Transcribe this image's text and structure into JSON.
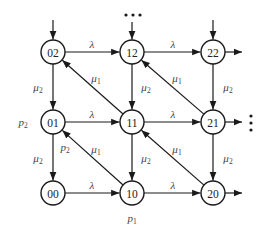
{
  "diagram": {
    "node_radius": 12,
    "nodes": [
      {
        "id": "02",
        "label": "02",
        "x": 53,
        "y": 52
      },
      {
        "id": "12",
        "label": "12",
        "x": 132,
        "y": 52
      },
      {
        "id": "22",
        "label": "22",
        "x": 213,
        "y": 52
      },
      {
        "id": "01",
        "label": "01",
        "x": 53,
        "y": 122
      },
      {
        "id": "11",
        "label": "11",
        "x": 132,
        "y": 122
      },
      {
        "id": "21",
        "label": "21",
        "x": 213,
        "y": 122
      },
      {
        "id": "00",
        "label": "00",
        "x": 53,
        "y": 193
      },
      {
        "id": "10",
        "label": "10",
        "x": 132,
        "y": 193
      },
      {
        "id": "20",
        "label": "20",
        "x": 213,
        "y": 193
      }
    ],
    "edges": [
      {
        "from": "02",
        "to": "12",
        "label": "λ"
      },
      {
        "from": "12",
        "to": "22",
        "label": "λ"
      },
      {
        "from": "01",
        "to": "11",
        "label": "λ"
      },
      {
        "from": "11",
        "to": "21",
        "label": "λ"
      },
      {
        "from": "00",
        "to": "10",
        "label": "λ"
      },
      {
        "from": "10",
        "to": "20",
        "label": "λ"
      },
      {
        "from": "02",
        "to": "01",
        "label": "μ2"
      },
      {
        "from": "01",
        "to": "00",
        "label": "μ2"
      },
      {
        "from": "12",
        "to": "11",
        "label": "μ2"
      },
      {
        "from": "11",
        "to": "10",
        "label": "μ2"
      },
      {
        "from": "22",
        "to": "21",
        "label": "μ2"
      },
      {
        "from": "21",
        "to": "20",
        "label": "μ2"
      },
      {
        "from": "11",
        "to": "02",
        "label": "μ1"
      },
      {
        "from": "21",
        "to": "12",
        "label": "μ1"
      },
      {
        "from": "10",
        "to": "01",
        "label": "μ1"
      },
      {
        "from": "20",
        "to": "11",
        "label": "μ1"
      }
    ],
    "incoming": [
      {
        "to": "02",
        "x1": 53,
        "y1": 20
      },
      {
        "to": "12",
        "x1": 132,
        "y1": 22
      },
      {
        "to": "22",
        "x1": 213,
        "y1": 20
      }
    ],
    "outgoing": [
      {
        "from": "22",
        "x2": 242,
        "y2": 52
      },
      {
        "from": "21",
        "x2": 242,
        "y2": 122
      },
      {
        "from": "20",
        "x2": 242,
        "y2": 193
      }
    ],
    "labels": [
      {
        "text": "λ",
        "sub": "",
        "x": 92,
        "y": 44
      },
      {
        "text": "λ",
        "sub": "",
        "x": 173,
        "y": 44
      },
      {
        "text": "λ",
        "sub": "",
        "x": 92,
        "y": 114
      },
      {
        "text": "λ",
        "sub": "",
        "x": 173,
        "y": 114
      },
      {
        "text": "λ",
        "sub": "",
        "x": 92,
        "y": 185
      },
      {
        "text": "λ",
        "sub": "",
        "x": 173,
        "y": 185
      },
      {
        "text": "μ",
        "sub": "2",
        "x": 38,
        "y": 87
      },
      {
        "text": "μ",
        "sub": "2",
        "x": 38,
        "y": 158
      },
      {
        "text": "μ",
        "sub": "2",
        "x": 146,
        "y": 87
      },
      {
        "text": "μ",
        "sub": "2",
        "x": 146,
        "y": 158
      },
      {
        "text": "μ",
        "sub": "2",
        "x": 228,
        "y": 87
      },
      {
        "text": "μ",
        "sub": "2",
        "x": 228,
        "y": 158
      },
      {
        "text": "μ",
        "sub": "1",
        "x": 96,
        "y": 78
      },
      {
        "text": "μ",
        "sub": "1",
        "x": 177,
        "y": 78
      },
      {
        "text": "μ",
        "sub": "1",
        "x": 96,
        "y": 149
      },
      {
        "text": "μ",
        "sub": "1",
        "x": 177,
        "y": 149
      },
      {
        "text": "p",
        "sub": "2",
        "x": 23,
        "y": 122
      },
      {
        "text": "p",
        "sub": "2",
        "x": 65,
        "y": 147
      },
      {
        "text": "p",
        "sub": "1",
        "x": 132,
        "y": 218
      }
    ],
    "ellipsis_horizontal": {
      "x": 133,
      "y": 15,
      "spacing": 7
    },
    "ellipsis_vertical": {
      "x": 251,
      "y": 123,
      "spacing": 7
    }
  }
}
